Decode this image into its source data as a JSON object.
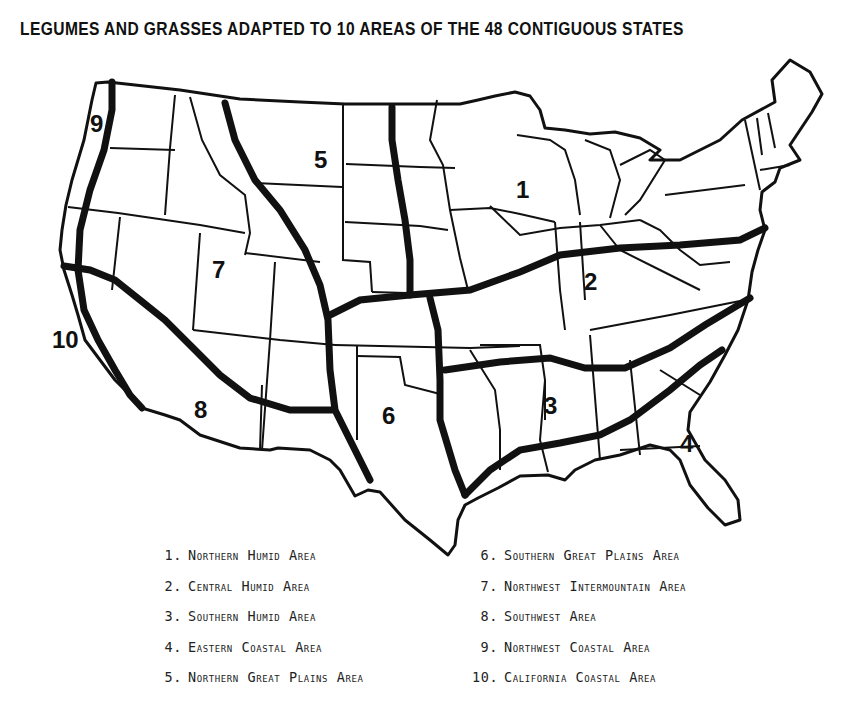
{
  "title": "LEGUMES AND GRASSES ADAPTED TO 10  AREAS OF THE 48 CONTIGUOUS STATES",
  "map": {
    "region_labels": [
      {
        "id": "1",
        "x": 520,
        "y": 198
      },
      {
        "id": "2",
        "x": 586,
        "y": 290
      },
      {
        "id": "3",
        "x": 546,
        "y": 413
      },
      {
        "id": "4",
        "x": 680,
        "y": 452
      },
      {
        "id": "5",
        "x": 316,
        "y": 168
      },
      {
        "id": "6",
        "x": 383,
        "y": 422
      },
      {
        "id": "7",
        "x": 214,
        "y": 278
      },
      {
        "id": "8",
        "x": 194,
        "y": 418
      },
      {
        "id": "9",
        "x": 90,
        "y": 132
      },
      {
        "id": "10",
        "x": 54,
        "y": 348
      }
    ],
    "colors": {
      "outline": "#111111",
      "background": "#ffffff"
    }
  },
  "legend": {
    "left": [
      {
        "num": "1.",
        "label": "Northern Humid Area"
      },
      {
        "num": "2.",
        "label": "Central Humid Area"
      },
      {
        "num": "3.",
        "label": "Southern Humid Area"
      },
      {
        "num": "4.",
        "label": "Eastern Coastal Area"
      },
      {
        "num": "5.",
        "label": "Northern Great Plains Area"
      }
    ],
    "right": [
      {
        "num": "6.",
        "label": "Southern Great Plains Area"
      },
      {
        "num": "7.",
        "label": "Northwest Intermountain Area"
      },
      {
        "num": "8.",
        "label": "Southwest Area"
      },
      {
        "num": "9.",
        "label": "Northwest Coastal Area"
      },
      {
        "num": "10.",
        "label": "California Coastal Area"
      }
    ]
  }
}
